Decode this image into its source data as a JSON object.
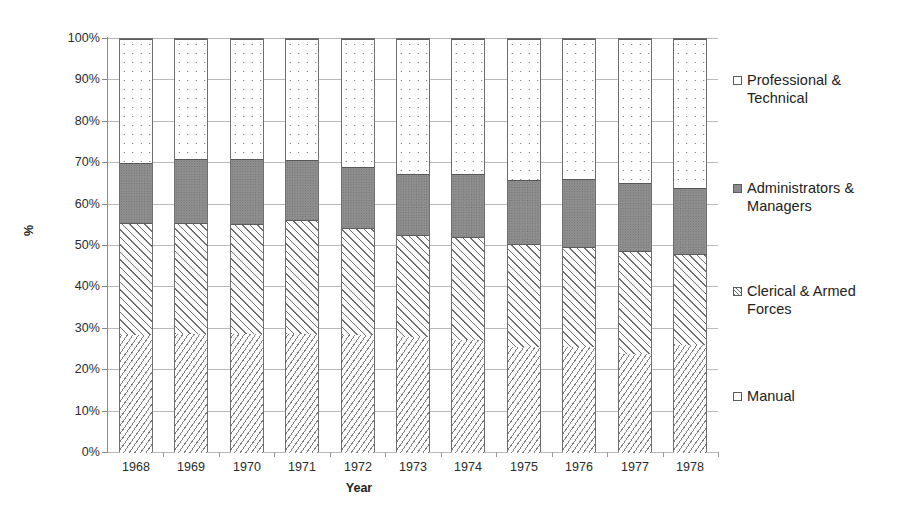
{
  "chart_data": {
    "type": "bar",
    "subtype": "stacked-percent-column",
    "title": "",
    "xlabel": "Year",
    "ylabel": "%",
    "ylim": [
      0,
      100
    ],
    "y_tick_labels": [
      "0%",
      "10%",
      "20%",
      "30%",
      "40%",
      "50%",
      "60%",
      "70%",
      "80%",
      "90%",
      "100%"
    ],
    "y_ticks": [
      0,
      10,
      20,
      30,
      40,
      50,
      60,
      70,
      80,
      90,
      100
    ],
    "grid": true,
    "legend_position": "right",
    "categories": [
      "1968",
      "1969",
      "1970",
      "1971",
      "1972",
      "1973",
      "1974",
      "1975",
      "1976",
      "1977",
      "1978"
    ],
    "series": [
      {
        "name": "Manual",
        "pattern": "fine-diagonal-hatch",
        "values": [
          28.5,
          28.8,
          28.8,
          28.8,
          28.5,
          28.0,
          27.3,
          25.7,
          25.5,
          23.8,
          26.0
        ]
      },
      {
        "name": "Clerical & Armed Forces",
        "pattern": "wide-diagonal-hatch",
        "values": [
          27.0,
          26.7,
          26.5,
          27.5,
          25.8,
          24.7,
          24.9,
          24.9,
          24.3,
          25.0,
          22.0
        ]
      },
      {
        "name": "Administrators & Managers",
        "pattern": "solid-gray",
        "values": [
          14.5,
          15.5,
          15.7,
          14.5,
          14.9,
          14.6,
          15.1,
          15.4,
          16.4,
          16.4,
          16.0
        ]
      },
      {
        "name": "Professional & Technical",
        "pattern": "dotted",
        "values": [
          30.0,
          29.0,
          29.0,
          29.2,
          30.8,
          32.7,
          32.7,
          34.0,
          33.8,
          34.8,
          36.0
        ]
      }
    ],
    "cumulative_tops": {
      "manual": [
        28.5,
        28.8,
        28.8,
        28.8,
        28.5,
        28.0,
        27.3,
        25.7,
        25.5,
        23.8,
        26.0
      ],
      "clerical": [
        55.5,
        55.5,
        55.3,
        56.3,
        54.3,
        52.7,
        52.2,
        50.6,
        49.8,
        48.8,
        48.0
      ],
      "admin": [
        70.0,
        71.0,
        71.0,
        70.8,
        69.2,
        67.3,
        67.3,
        66.0,
        66.2,
        65.2,
        64.0
      ],
      "prof": [
        100,
        100,
        100,
        100,
        100,
        100,
        100,
        100,
        100,
        100,
        100
      ]
    }
  },
  "legend": {
    "items": [
      {
        "label": "Professional &\nTechnical",
        "swatch": "prof-swatch-icon"
      },
      {
        "label": "Administrators &\nManagers",
        "swatch": "admin-swatch-icon"
      },
      {
        "label": "Clerical & Armed\nForces",
        "swatch": "clerical-swatch-icon"
      },
      {
        "label": "Manual",
        "swatch": "manual-swatch-icon"
      }
    ]
  },
  "colors": {
    "admin_fill": "#8e8e8e",
    "gridline": "#b9b9b9",
    "axis": "#8a8a8a",
    "bar_border": "#6f6f6f",
    "text": "#2b2b2b"
  }
}
